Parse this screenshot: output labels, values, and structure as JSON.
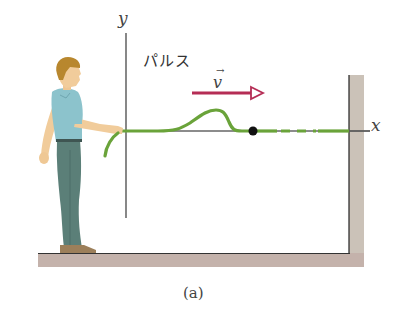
{
  "figure": {
    "caption": "(a)",
    "labels": {
      "y_axis": "y",
      "x_axis": "x",
      "pulse": "パルス",
      "velocity": "v",
      "velocity_vector_mark": "→"
    },
    "colors": {
      "rope": "#6aa33a",
      "axis": "#555555",
      "velocity_arrow": "#b52d55",
      "floor": "#c2b1aa",
      "wall": "#c9c0b6",
      "shirt": "#8cc3cc",
      "pants": "#5b7f78",
      "hair": "#b8872e",
      "skin": "#f1cc9b",
      "shoes": "#9c7f5a",
      "marker_dot": "#111111"
    },
    "elements": [
      "person holding rope",
      "pulse traveling on rope",
      "velocity arrow",
      "black marker dot on rope",
      "dashed rope section",
      "fixed wall"
    ]
  }
}
